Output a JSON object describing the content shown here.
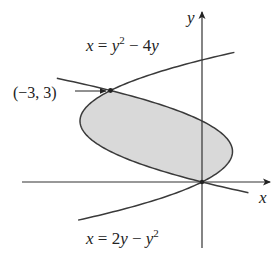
{
  "chart_data": {
    "type": "region-plot",
    "title": "",
    "curves": [
      {
        "name": "x = y^2 - 4y",
        "label": "x = y² − 4y",
        "equation": "x = y^2 - 4y",
        "y_range": [
          -0.35,
          4.25
        ]
      },
      {
        "name": "x = 2y - y^2",
        "label": "x = 2y − y²",
        "equation": "x = 2y - y^2",
        "y_range": [
          -1.25,
          3.4
        ]
      }
    ],
    "shaded_region": {
      "between": [
        "x = y^2 - 4y",
        "x = 2y - y^2"
      ],
      "y_range": [
        0,
        3
      ],
      "fill": "#d9d9d9"
    },
    "intersection_points": [
      {
        "x": -3,
        "y": 3,
        "label": "(−3, 3)",
        "marked": true
      },
      {
        "x": 0,
        "y": 0,
        "label": "",
        "marked": true
      }
    ],
    "xlabel": "x",
    "ylabel": "y",
    "grid": false,
    "origin_px": [
      202,
      182
    ],
    "scale_px_per_unit": 30.5
  },
  "labels": {
    "curve_top": {
      "x": "x",
      "eq": " = ",
      "y": "y",
      "sup": "2",
      "rest": " − 4",
      "y2": "y"
    },
    "curve_bottom": {
      "x": "x",
      "eq": " = 2",
      "y": "y",
      "minus": " − ",
      "y2": "y",
      "sup": "2"
    },
    "point": "(−3, 3)",
    "x_axis": "x",
    "y_axis": "y"
  },
  "colors": {
    "curve": "#3a3a3a",
    "axis": "#333333",
    "fill": "#d9d9d9",
    "text": "#222222"
  }
}
